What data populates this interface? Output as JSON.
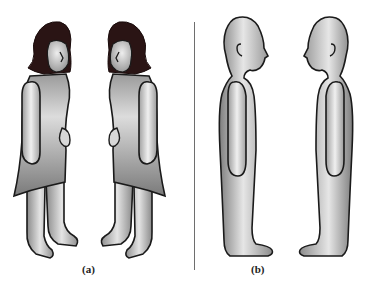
{
  "figure": {
    "panels": [
      {
        "id": "a",
        "caption": "(a)",
        "description": "Two cartoon women with dark shoulder-length hair and grey dresses standing face to face, heads bowed",
        "figures": [
          "woman-facing-right",
          "woman-facing-left"
        ]
      },
      {
        "id": "b",
        "caption": "(b)",
        "description": "Two bald grey silhouette humans in profile standing upright facing each other",
        "figures": [
          "person-facing-right",
          "person-facing-left"
        ]
      }
    ],
    "colors": {
      "body_fill_light": "#e8e8e8",
      "body_fill_dark": "#8a8a8a",
      "outline": "#1a1a1a",
      "hair": "#2a1414",
      "divider": "#6e6e6e"
    }
  }
}
